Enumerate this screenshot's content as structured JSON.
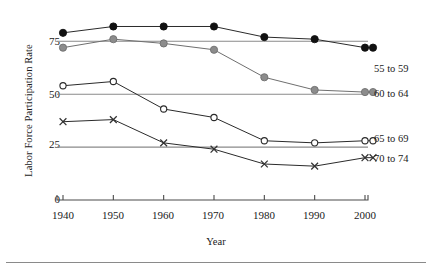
{
  "chart_data": {
    "type": "line",
    "title": "",
    "xlabel": "Year",
    "ylabel": "Labor Force Participation Rate",
    "x": [
      1940,
      1950,
      1960,
      1970,
      1980,
      1990,
      2000
    ],
    "xtick_labels": [
      "1940",
      "1950",
      "1960",
      "1970",
      "1980",
      "1990",
      "2000"
    ],
    "ytick_labels": [
      "0",
      "25",
      "50",
      "75"
    ],
    "yticks": [
      0,
      25,
      50,
      75
    ],
    "xlim": [
      1940,
      2000
    ],
    "ylim": [
      0,
      90
    ],
    "grid": "horizontal gridlines at 25, 50, 75",
    "legend_position": "right-of-plot, end-of-line labels",
    "series": [
      {
        "name": "55 to 59",
        "marker": "filled-circle",
        "color": "#111111",
        "values": [
          79,
          82,
          82,
          82,
          77,
          76,
          72
        ]
      },
      {
        "name": "60 to 64",
        "marker": "filled-circle-gray",
        "color": "#8c8c8c",
        "values": [
          72,
          76,
          74,
          71,
          58,
          52,
          51
        ]
      },
      {
        "name": "65 to 69",
        "marker": "open-circle",
        "color": "#ffffff",
        "values": [
          54,
          56,
          43,
          39,
          28,
          27,
          28
        ]
      },
      {
        "name": "70 to 74",
        "marker": "x-cross",
        "color": "#333333",
        "values": [
          37,
          38,
          27,
          24,
          17,
          16,
          20
        ]
      }
    ]
  },
  "axes": {
    "y_title": "Labor Force Participation Rate",
    "x_title": "Year"
  },
  "ticks": {
    "y": [
      "75",
      "50",
      "25",
      "0"
    ],
    "x": [
      "1940",
      "1950",
      "1960",
      "1970",
      "1980",
      "1990",
      "2000"
    ]
  },
  "legend": {
    "items": [
      {
        "label": "55 to 59"
      },
      {
        "label": "60 to 64"
      },
      {
        "label": "65 to 69"
      },
      {
        "label": "70 to 74"
      }
    ]
  },
  "colors": {
    "series_55_59": "#111111",
    "series_60_64": "#8c8c8c",
    "series_65_69": "#444444",
    "series_70_74": "#333333",
    "gridline": "#8a8a8a",
    "axis": "#4a4a4a",
    "background": "#ffffff"
  }
}
